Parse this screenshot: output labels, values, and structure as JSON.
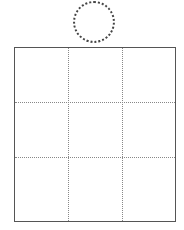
{
  "diagram": {
    "title": "",
    "shapes": [
      {
        "type": "circle",
        "style": "dotted",
        "label": ""
      },
      {
        "type": "grid",
        "rows": 3,
        "cols": 3,
        "border": "solid",
        "dividers": "dotted",
        "cells": [
          "",
          "",
          "",
          "",
          "",
          "",
          "",
          "",
          ""
        ]
      }
    ]
  }
}
